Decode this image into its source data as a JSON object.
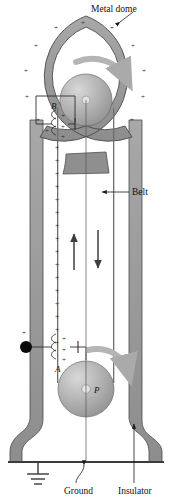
{
  "figure": {
    "width": 172,
    "height": 500
  },
  "labels": {
    "metal_dome": "Metal dome",
    "belt": "Belt",
    "ground": "Ground",
    "insulator": "Insulator",
    "comb_upper": "B",
    "comb_lower": "A",
    "pulley_lower": "P",
    "terminal_charge": "+"
  },
  "colors": {
    "metal_gray": "#9a9a9a",
    "metal_gray_dark": "#7d7d7d",
    "belt_gray": "#8e8e8e",
    "outline": "#3a3a3a",
    "label_text": "#111111",
    "arrow_light": "#b3b3b3",
    "arrow_dark": "#3f3f3f",
    "terminal_black": "#0a0a0a",
    "background": "#ffffff"
  },
  "charge_marks": {
    "symbol": "+",
    "dome_ring_count": 12,
    "belt_column_count": 16,
    "comb_upper_count": 3,
    "comb_lower_count": 3
  },
  "annotations": {
    "dome_rotation": "clockwise",
    "pulley_rotation": "clockwise",
    "belt_left_direction": "up",
    "belt_right_direction": "down"
  }
}
